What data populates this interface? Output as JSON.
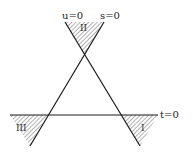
{
  "diagram": {
    "title": "",
    "lines": [
      {
        "id": "u",
        "label": "u=0"
      },
      {
        "id": "s",
        "label": "s=0"
      },
      {
        "id": "t",
        "label": "t=0"
      }
    ],
    "regions": [
      {
        "id": "I",
        "label": "I"
      },
      {
        "id": "II",
        "label": "II"
      },
      {
        "id": "III",
        "label": "III"
      }
    ],
    "colors": {
      "line": "#1a1a1a",
      "hatch": "#555555",
      "background": "#ffffff"
    }
  }
}
